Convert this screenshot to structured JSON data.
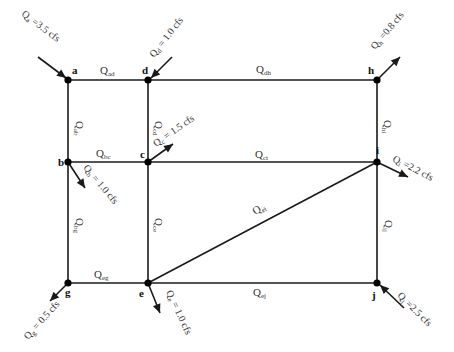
{
  "unit": "cfs",
  "nodes": [
    {
      "id": "a",
      "label": "a"
    },
    {
      "id": "d",
      "label": "d"
    },
    {
      "id": "h",
      "label": "h"
    },
    {
      "id": "b",
      "label": "b"
    },
    {
      "id": "c",
      "label": "c"
    },
    {
      "id": "i",
      "label": "i"
    },
    {
      "id": "g",
      "label": "g"
    },
    {
      "id": "e",
      "label": "e"
    },
    {
      "id": "j",
      "label": "j"
    }
  ],
  "pipes": [
    {
      "id": "ad",
      "from": "a",
      "to": "d",
      "label_main": "Q",
      "label_sub": "ad"
    },
    {
      "id": "dh",
      "from": "d",
      "to": "h",
      "label_main": "Q",
      "label_sub": "dh"
    },
    {
      "id": "ab",
      "from": "a",
      "to": "b",
      "label_main": "Q",
      "label_sub": "ab"
    },
    {
      "id": "cd",
      "from": "c",
      "to": "d",
      "label_main": "Q",
      "label_sub": "cd"
    },
    {
      "id": "hi",
      "from": "h",
      "to": "i",
      "label_main": "Q",
      "label_sub": "hi"
    },
    {
      "id": "bc",
      "from": "b",
      "to": "c",
      "label_main": "Q",
      "label_sub": "bc"
    },
    {
      "id": "ci",
      "from": "c",
      "to": "i",
      "label_main": "Q",
      "label_sub": "ci"
    },
    {
      "id": "bg",
      "from": "b",
      "to": "g",
      "label_main": "Q",
      "label_sub": "bg"
    },
    {
      "id": "ce",
      "from": "c",
      "to": "e",
      "label_main": "Q",
      "label_sub": "ce"
    },
    {
      "id": "ei",
      "from": "e",
      "to": "i",
      "label_main": "Q",
      "label_sub": "ei"
    },
    {
      "id": "ij",
      "from": "i",
      "to": "j",
      "label_main": "Q",
      "label_sub": "ij"
    },
    {
      "id": "eg",
      "from": "e",
      "to": "g",
      "label_main": "Q",
      "label_sub": "eg"
    },
    {
      "id": "ej",
      "from": "e",
      "to": "j",
      "label_main": "Q",
      "label_sub": "ej"
    }
  ],
  "external_flows": [
    {
      "node": "a",
      "direction": "inflow",
      "label_main": "Q",
      "label_sub": "a",
      "value_text": " =3.5 cfs",
      "value": 3.5
    },
    {
      "node": "d",
      "direction": "inflow",
      "label_main": "Q",
      "label_sub": "d",
      "value_text": " = 1.0 cfs",
      "value": 1.0
    },
    {
      "node": "h",
      "direction": "outflow",
      "label_main": "Q",
      "label_sub": "h",
      "value_text": " =0.8 cfs",
      "value": 0.8
    },
    {
      "node": "c",
      "direction": "outflow",
      "label_main": "Q",
      "label_sub": "c",
      "value_text": " = 1.5 cfs",
      "value": 1.5
    },
    {
      "node": "b",
      "direction": "outflow",
      "label_main": "Q",
      "label_sub": "b",
      "value_text": " = 1.0 cfs",
      "value": 1.0
    },
    {
      "node": "i",
      "direction": "outflow",
      "label_main": "Q",
      "label_sub": "i",
      "value_text": " =2.2 cfs",
      "value": 2.2
    },
    {
      "node": "g",
      "direction": "outflow",
      "label_main": "Q",
      "label_sub": "g",
      "value_text": " = 0.5 cfs",
      "value": 0.5
    },
    {
      "node": "e",
      "direction": "outflow",
      "label_main": "Q",
      "label_sub": "e",
      "value_text": " = 1.0 cfs",
      "value": 1.0
    },
    {
      "node": "j",
      "direction": "inflow",
      "label_main": "Q",
      "label_sub": "j",
      "value_text": " =2.5 cfs",
      "value": 2.5
    }
  ]
}
